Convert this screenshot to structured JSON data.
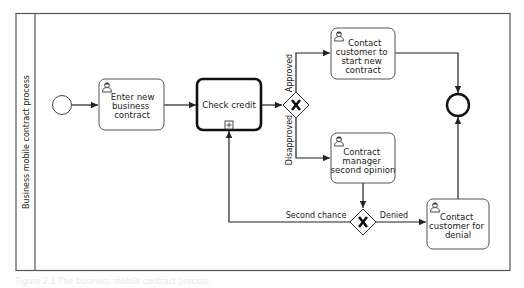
{
  "pool": {
    "label": "Business mobile contract process"
  },
  "tasks": [
    {
      "id": "enter",
      "lines": [
        "Enter new",
        "business",
        "contract"
      ],
      "type": "user"
    },
    {
      "id": "check",
      "lines": [
        "Check credit"
      ],
      "type": "subprocess"
    },
    {
      "id": "contact_start",
      "lines": [
        "Contact",
        "customer to",
        "start new",
        "contract"
      ],
      "type": "user"
    },
    {
      "id": "second_opinion",
      "lines": [
        "Contract",
        "manager",
        "second opinion"
      ],
      "type": "user"
    },
    {
      "id": "denial",
      "lines": [
        "Contact",
        "customer for",
        "denial"
      ],
      "type": "user"
    }
  ],
  "flows": {
    "approved": "Approved",
    "disapproved": "Disapproved",
    "second_chance": "Second chance",
    "denied": "Denied"
  },
  "caption": "Figure 2.1  The business mobile contract process"
}
